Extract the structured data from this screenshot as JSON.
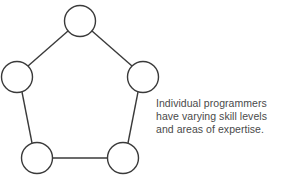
{
  "figure": {
    "type": "node-network-diagram",
    "background_color": "#ffffff",
    "stroke_color": "#3a3a3a",
    "text_color": "#4a4a4a",
    "node_fill": "#ffffff",
    "stroke_width": 1.4,
    "width": 284,
    "height": 189
  },
  "nodes": [
    {
      "id": "top",
      "name": "node-top",
      "cx": 80,
      "cy": 21,
      "r": 15.5
    },
    {
      "id": "left",
      "name": "node-left",
      "cx": 17,
      "cy": 77,
      "r": 15.5
    },
    {
      "id": "right",
      "name": "node-right",
      "cx": 143,
      "cy": 77,
      "r": 15.5
    },
    {
      "id": "bottom-left",
      "name": "node-bottom-left",
      "cx": 37,
      "cy": 158,
      "r": 15.5
    },
    {
      "id": "bottom-right",
      "name": "node-bottom-right",
      "cx": 123,
      "cy": 158,
      "r": 15.5
    }
  ],
  "edges": [
    {
      "id": "top-left",
      "from": "top",
      "to": "left",
      "x1": 68,
      "y1": 31,
      "x2": 28,
      "y2": 66
    },
    {
      "id": "top-right",
      "from": "top",
      "to": "right",
      "x1": 92,
      "y1": 31,
      "x2": 132,
      "y2": 66
    },
    {
      "id": "left-bottomleft",
      "from": "left",
      "to": "bottom-left",
      "x1": 22,
      "y1": 92,
      "x2": 32,
      "y2": 143
    },
    {
      "id": "right-bottomright",
      "from": "right",
      "to": "bottom-right",
      "x1": 138,
      "y1": 92,
      "x2": 128,
      "y2": 143
    },
    {
      "id": "bottomleft-bottomright",
      "from": "bottom-left",
      "to": "bottom-right",
      "x1": 53,
      "y1": 158,
      "x2": 107,
      "y2": 158
    }
  ],
  "caption": {
    "lines": [
      "Individual programmers",
      "have varying skill levels",
      "and areas of expertise."
    ],
    "full_text": "Individual programmers have varying skill levels and areas of expertise."
  }
}
